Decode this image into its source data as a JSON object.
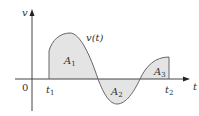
{
  "diagram": {
    "y_axis_label": "v",
    "x_axis_label": "t",
    "origin_label": "0",
    "curve_label": "v(t)",
    "t1_label": "t",
    "t1_sub": "1",
    "t2_label": "t",
    "t2_sub": "2",
    "regions": [
      {
        "label": "A",
        "sub": "1",
        "sign": "positive"
      },
      {
        "label": "A",
        "sub": "2",
        "sign": "negative"
      },
      {
        "label": "A",
        "sub": "3",
        "sign": "positive"
      }
    ],
    "colors": {
      "fill": "#e4e4e4",
      "curve": "#666666",
      "axis": "#444444"
    }
  }
}
